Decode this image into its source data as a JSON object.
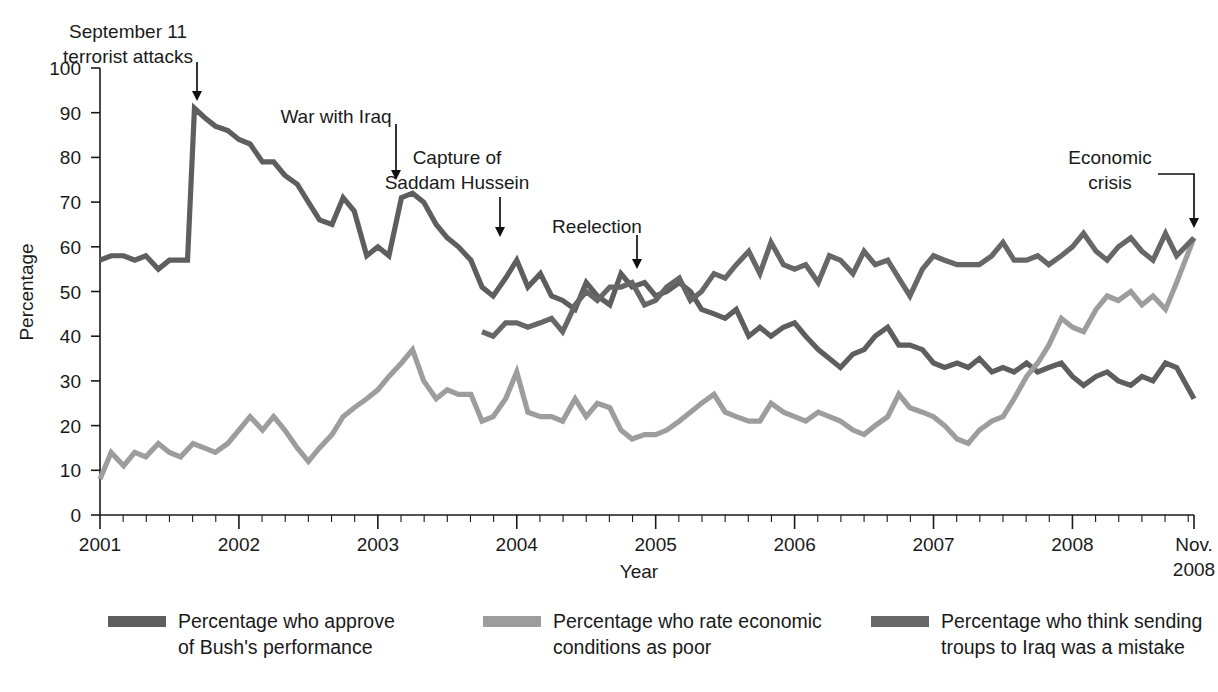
{
  "chart_data": {
    "type": "line",
    "title": "",
    "xlabel": "Year",
    "ylabel": "Percentage",
    "xlim": [
      2001.0,
      2008.875
    ],
    "ylim": [
      0,
      100
    ],
    "grid": false,
    "legend_position": "bottom",
    "y_ticks": [
      0,
      10,
      20,
      30,
      40,
      50,
      60,
      70,
      80,
      90,
      100
    ],
    "y_tick_labels": [
      "0",
      "10",
      "20",
      "30",
      "40",
      "50",
      "60",
      "70",
      "80",
      "90",
      "100"
    ],
    "x_ticks": [
      2001,
      2002,
      2003,
      2004,
      2005,
      2006,
      2007,
      2008,
      2008.875
    ],
    "x_tick_labels": [
      "2001",
      "2002",
      "2003",
      "2004",
      "2005",
      "2006",
      "2007",
      "2008",
      "Nov.\n2008"
    ],
    "x_minor_tick_interval_months": 2,
    "annotations": [
      {
        "label": "September 11\nterrorist attacks",
        "text_x": 128,
        "text_y": 22,
        "arrow_x": 197,
        "arrow_y0": 62,
        "arrow_y1": 101,
        "kind": "down-arrow"
      },
      {
        "label": "War with Iraq",
        "text_x": 336,
        "text_y": 107,
        "arrow_x": 396,
        "arrow_y0": 124,
        "arrow_y1": 180,
        "kind": "down-arrow"
      },
      {
        "label": "Capture of\nSaddam Hussein",
        "text_x": 457,
        "text_y": 148,
        "arrow_x": 500,
        "arrow_y0": 197,
        "arrow_y1": 237,
        "kind": "down-arrow"
      },
      {
        "label": "Reelection",
        "text_x": 597,
        "text_y": 217,
        "arrow_x": 637,
        "arrow_y0": 235,
        "arrow_y1": 269,
        "kind": "down-arrow"
      },
      {
        "label": "Economic\ncrisis",
        "text_x": 1110,
        "text_y": 148,
        "arrow_x": 1194,
        "arrow_y0": 186,
        "arrow_y1": 228,
        "kind": "elbow-arrow"
      }
    ],
    "series": [
      {
        "name": "Percentage who approve of Bush's performance",
        "legend_label": "Percentage who approve\nof Bush's performance",
        "color": "#5e5e5e",
        "start_year": 2001.0,
        "x": [
          2001.0,
          2001.08,
          2001.17,
          2001.25,
          2001.33,
          2001.42,
          2001.5,
          2001.58,
          2001.63,
          2001.68,
          2001.75,
          2001.83,
          2001.92,
          2002.0,
          2002.08,
          2002.17,
          2002.25,
          2002.33,
          2002.42,
          2002.5,
          2002.58,
          2002.67,
          2002.75,
          2002.83,
          2002.92,
          2003.0,
          2003.08,
          2003.17,
          2003.25,
          2003.33,
          2003.42,
          2003.5,
          2003.58,
          2003.67,
          2003.75,
          2003.83,
          2003.92,
          2004.0,
          2004.08,
          2004.17,
          2004.25,
          2004.33,
          2004.42,
          2004.5,
          2004.58,
          2004.67,
          2004.75,
          2004.83,
          2004.92,
          2005.0,
          2005.08,
          2005.17,
          2005.25,
          2005.33,
          2005.42,
          2005.5,
          2005.58,
          2005.67,
          2005.75,
          2005.83,
          2005.92,
          2006.0,
          2006.08,
          2006.17,
          2006.25,
          2006.33,
          2006.42,
          2006.5,
          2006.58,
          2006.67,
          2006.75,
          2006.83,
          2006.92,
          2007.0,
          2007.08,
          2007.17,
          2007.25,
          2007.33,
          2007.42,
          2007.5,
          2007.58,
          2007.67,
          2007.75,
          2007.83,
          2007.92,
          2008.0,
          2008.08,
          2008.17,
          2008.25,
          2008.33,
          2008.42,
          2008.5,
          2008.58,
          2008.67,
          2008.75,
          2008.875
        ],
        "y": [
          57,
          58,
          58,
          57,
          58,
          55,
          57,
          57,
          57,
          91,
          89,
          87,
          86,
          84,
          83,
          79,
          79,
          76,
          74,
          70,
          66,
          65,
          71,
          68,
          58,
          60,
          58,
          71,
          72,
          70,
          65,
          62,
          60,
          57,
          51,
          49,
          53,
          57,
          51,
          54,
          49,
          48,
          46,
          52,
          49,
          47,
          54,
          51,
          52,
          49,
          50,
          52,
          50,
          46,
          45,
          44,
          46,
          40,
          42,
          40,
          42,
          43,
          40,
          37,
          35,
          33,
          36,
          37,
          40,
          42,
          38,
          38,
          37,
          34,
          33,
          34,
          33,
          35,
          32,
          33,
          32,
          34,
          32,
          33,
          34,
          31,
          29,
          31,
          32,
          30,
          29,
          31,
          30,
          34,
          33,
          26
        ]
      },
      {
        "name": "Percentage who rate economic conditions as poor",
        "legend_label": "Percentage who rate economic\nconditions as poor",
        "color": "#9d9d9d",
        "start_year": 2001.0,
        "x": [
          2001.0,
          2001.08,
          2001.17,
          2001.25,
          2001.33,
          2001.42,
          2001.5,
          2001.58,
          2001.67,
          2001.75,
          2001.83,
          2001.92,
          2002.0,
          2002.08,
          2002.17,
          2002.25,
          2002.33,
          2002.42,
          2002.5,
          2002.58,
          2002.67,
          2002.75,
          2002.83,
          2002.92,
          2003.0,
          2003.08,
          2003.17,
          2003.25,
          2003.33,
          2003.42,
          2003.5,
          2003.58,
          2003.67,
          2003.75,
          2003.83,
          2003.92,
          2004.0,
          2004.08,
          2004.17,
          2004.25,
          2004.33,
          2004.42,
          2004.5,
          2004.58,
          2004.67,
          2004.75,
          2004.83,
          2004.92,
          2005.0,
          2005.08,
          2005.17,
          2005.25,
          2005.33,
          2005.42,
          2005.5,
          2005.58,
          2005.67,
          2005.75,
          2005.83,
          2005.92,
          2006.0,
          2006.08,
          2006.17,
          2006.25,
          2006.33,
          2006.42,
          2006.5,
          2006.58,
          2006.67,
          2006.75,
          2006.83,
          2006.92,
          2007.0,
          2007.08,
          2007.17,
          2007.25,
          2007.33,
          2007.42,
          2007.5,
          2007.58,
          2007.67,
          2007.75,
          2007.83,
          2007.92,
          2008.0,
          2008.08,
          2008.17,
          2008.25,
          2008.33,
          2008.42,
          2008.5,
          2008.58,
          2008.67,
          2008.75,
          2008.875
        ],
        "y": [
          8,
          14,
          11,
          14,
          13,
          16,
          14,
          13,
          16,
          15,
          14,
          16,
          19,
          22,
          19,
          22,
          19,
          15,
          12,
          15,
          18,
          22,
          24,
          26,
          28,
          31,
          34,
          37,
          30,
          26,
          28,
          27,
          27,
          21,
          22,
          26,
          32,
          23,
          22,
          22,
          21,
          26,
          22,
          25,
          24,
          19,
          17,
          18,
          18,
          19,
          21,
          23,
          25,
          27,
          23,
          22,
          21,
          21,
          25,
          23,
          22,
          21,
          23,
          22,
          21,
          19,
          18,
          20,
          22,
          27,
          24,
          23,
          22,
          20,
          17,
          16,
          19,
          21,
          22,
          26,
          31,
          34,
          38,
          44,
          42,
          41,
          46,
          49,
          48,
          50,
          47,
          49,
          46,
          52,
          62
        ]
      },
      {
        "name": "Percentage who think sending troups to Iraq was a mistake",
        "legend_label": "Percentage who think sending\ntroups to Iraq was a mistake",
        "color": "#676767",
        "start_year": 2003.75,
        "x": [
          2003.75,
          2003.83,
          2003.92,
          2004.0,
          2004.08,
          2004.17,
          2004.25,
          2004.33,
          2004.42,
          2004.5,
          2004.58,
          2004.67,
          2004.75,
          2004.83,
          2004.92,
          2005.0,
          2005.08,
          2005.17,
          2005.25,
          2005.33,
          2005.42,
          2005.5,
          2005.58,
          2005.67,
          2005.75,
          2005.83,
          2005.92,
          2006.0,
          2006.08,
          2006.17,
          2006.25,
          2006.33,
          2006.42,
          2006.5,
          2006.58,
          2006.67,
          2006.75,
          2006.83,
          2006.92,
          2007.0,
          2007.08,
          2007.17,
          2007.25,
          2007.33,
          2007.42,
          2007.5,
          2007.58,
          2007.67,
          2007.75,
          2007.83,
          2007.92,
          2008.0,
          2008.08,
          2008.17,
          2008.25,
          2008.33,
          2008.42,
          2008.5,
          2008.58,
          2008.67,
          2008.75,
          2008.875
        ],
        "y": [
          41,
          40,
          43,
          43,
          42,
          43,
          44,
          41,
          47,
          50,
          48,
          51,
          51,
          52,
          47,
          48,
          51,
          53,
          48,
          50,
          54,
          53,
          56,
          59,
          54,
          61,
          56,
          55,
          56,
          52,
          58,
          57,
          54,
          59,
          56,
          57,
          53,
          49,
          55,
          58,
          57,
          56,
          56,
          56,
          58,
          61,
          57,
          57,
          58,
          56,
          58,
          60,
          63,
          59,
          57,
          60,
          62,
          59,
          57,
          63,
          58,
          62
        ]
      }
    ]
  },
  "axes": {
    "ylabel": "Percentage",
    "xlabel": "Year"
  },
  "legend": {
    "entries": [
      {
        "label": "Percentage who approve\nof Bush's performance",
        "color": "#5e5e5e"
      },
      {
        "label": "Percentage who rate economic\nconditions as poor",
        "color": "#9d9d9d"
      },
      {
        "label": "Percentage who think sending\ntroups to Iraq was a mistake",
        "color": "#676767"
      }
    ]
  }
}
